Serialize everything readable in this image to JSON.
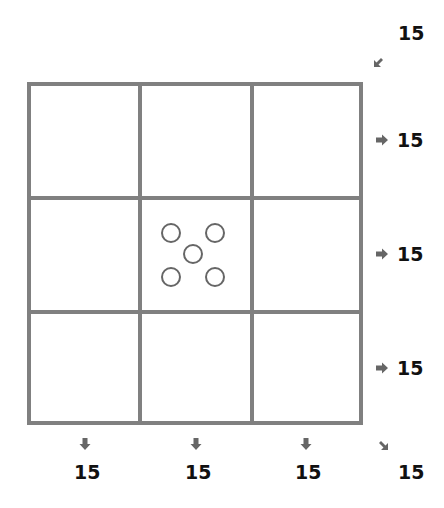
{
  "puzzle": {
    "type": "magic-square",
    "size": 3,
    "grid_color": "#808080",
    "cells": [
      {
        "row": 0,
        "col": 0,
        "value": null
      },
      {
        "row": 0,
        "col": 1,
        "value": null
      },
      {
        "row": 0,
        "col": 2,
        "value": null
      },
      {
        "row": 1,
        "col": 0,
        "value": null
      },
      {
        "row": 1,
        "col": 1,
        "value": 5,
        "display": "dice-five-empty-pips"
      },
      {
        "row": 1,
        "col": 2,
        "value": null
      },
      {
        "row": 2,
        "col": 0,
        "value": null
      },
      {
        "row": 2,
        "col": 1,
        "value": null
      },
      {
        "row": 2,
        "col": 2,
        "value": null
      }
    ],
    "row_sums": [
      "15",
      "15",
      "15"
    ],
    "col_sums": [
      "15",
      "15",
      "15"
    ],
    "anti_diagonal_sum": "15",
    "main_diagonal_sum": "15",
    "arrow_color": "#666666"
  }
}
